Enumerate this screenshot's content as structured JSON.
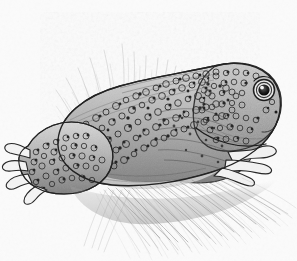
{
  "figure": {
    "medium": "pen-and-ink stipple drawing",
    "orientation": "profile facing right",
    "background_color": "#fbfbfb",
    "ink_color": "#2b2b2b",
    "mid_tone": "#8a8a8a",
    "light_tone": "#c9c9c9",
    "caption_fragment": "partially cropped caption text"
  },
  "parts": {
    "head": "head",
    "eye": "eye",
    "pupil": "pupil",
    "eye_highlight": "eye highlight",
    "snout": "snout",
    "mouth_line": "mouth line",
    "back": "back",
    "belly": "belly",
    "front_foot": "front foot",
    "hind_leg": "hind leg",
    "hind_foot": "hind foot",
    "warts": "warty skin tubercles",
    "grass": "grass blades",
    "ground_shadow": "ground shadow"
  },
  "counts": {
    "front_toes": 4,
    "hind_toes": 3,
    "grass_blades": 150,
    "warts": 420
  }
}
